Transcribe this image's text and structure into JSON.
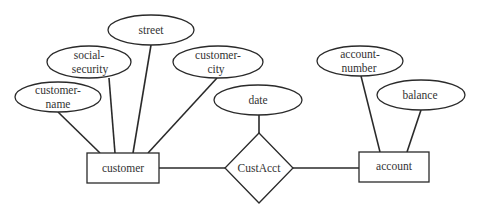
{
  "diagram": {
    "type": "er-diagram",
    "entities": [
      {
        "id": "customer",
        "label": "customer"
      },
      {
        "id": "account",
        "label": "account"
      }
    ],
    "relationships": [
      {
        "id": "custacct",
        "label": "CustAcct"
      }
    ],
    "attributes": {
      "customer_name": [
        "customer-",
        "name"
      ],
      "social_security": [
        "social-",
        "security"
      ],
      "street": [
        "street"
      ],
      "customer_city": [
        "customer-",
        "city"
      ],
      "date": [
        "date"
      ],
      "account_number": [
        "account-",
        "number"
      ],
      "balance": [
        "balance"
      ]
    },
    "edges": [
      [
        "customer-name",
        "customer"
      ],
      [
        "social-security",
        "customer"
      ],
      [
        "street",
        "customer"
      ],
      [
        "customer-city",
        "customer"
      ],
      [
        "customer",
        "CustAcct"
      ],
      [
        "date",
        "CustAcct"
      ],
      [
        "CustAcct",
        "account"
      ],
      [
        "account-number",
        "account"
      ],
      [
        "balance",
        "account"
      ]
    ]
  }
}
